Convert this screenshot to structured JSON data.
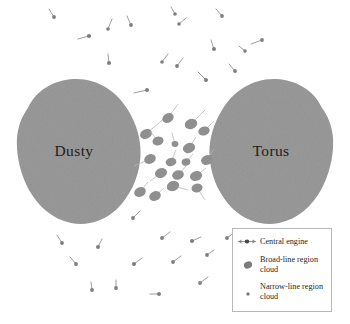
{
  "figure": {
    "type": "schematic-diagram",
    "background_color": "#ffffff"
  },
  "colors": {
    "torus_gray": "#9a9a9a",
    "cloud_gray": "#8f8f8f",
    "narrow_cloud_gray": "#7e7e7e",
    "line_gray": "#b5b5b5",
    "label_text": "#1d1d1d",
    "legend_border": "#b8b8b8",
    "legend_text": "#262626"
  },
  "torus": {
    "left_label": "Dusty",
    "right_label": "Torus"
  },
  "legend": {
    "items": [
      {
        "symbol": "central-engine-symbol",
        "label": "Central engine"
      },
      {
        "symbol": "broad-line-cloud-symbol",
        "label": "Broad-line region\ncloud"
      },
      {
        "symbol": "narrow-line-cloud-symbol",
        "label": "Narrow-line region\ncloud"
      }
    ]
  },
  "chart_data": {
    "type": "scatter",
    "title": "",
    "xlabel": "",
    "ylabel": "",
    "xlim": [
      0,
      350
    ],
    "ylim": [
      0,
      324
    ],
    "grid": false,
    "legend_position": "bottom-right",
    "annotations": [
      {
        "text": "Dusty",
        "x": 74,
        "y": 150
      },
      {
        "text": "Torus",
        "x": 268,
        "y": 150
      }
    ],
    "series": [
      {
        "name": "Dusty torus lobes",
        "type": "shape",
        "color": "#9a9a9a",
        "shapes": [
          {
            "id": "left-lobe",
            "cx": 79,
            "cy": 152,
            "rx": 64,
            "ry": 72
          },
          {
            "id": "right-lobe",
            "cx": 271,
            "cy": 152,
            "rx": 63,
            "ry": 72
          }
        ]
      },
      {
        "name": "Broad-line region cloud",
        "color": "#8f8f8f",
        "points": [
          {
            "x": 146,
            "y": 134,
            "rx": 6.2,
            "ry": 4.8,
            "rot": -25,
            "tail": [
              168,
              115
            ]
          },
          {
            "x": 168,
            "y": 118,
            "rx": 6.0,
            "ry": 4.6,
            "rot": -30,
            "tail": [
              178,
              104
            ]
          },
          {
            "x": 191,
            "y": 124,
            "rx": 6.4,
            "ry": 5.0,
            "rot": -20,
            "tail": [
              205,
              110
            ]
          },
          {
            "x": 204,
            "y": 131,
            "rx": 5.8,
            "ry": 4.4,
            "rot": -18,
            "tail": [
              214,
              121
            ]
          },
          {
            "x": 158,
            "y": 141,
            "rx": 5.6,
            "ry": 4.4,
            "rot": -15,
            "tail": [
              150,
              131
            ]
          },
          {
            "x": 175,
            "y": 144,
            "rx": 3.4,
            "ry": 3.0,
            "rot": 0,
            "tail": [
              172,
              133
            ]
          },
          {
            "x": 189,
            "y": 148,
            "rx": 6.3,
            "ry": 4.9,
            "rot": -22,
            "tail": [
              196,
              137
            ]
          },
          {
            "x": 150,
            "y": 159,
            "rx": 6.0,
            "ry": 4.7,
            "rot": -25,
            "tail": [
              134,
              166
            ]
          },
          {
            "x": 171,
            "y": 162,
            "rx": 5.4,
            "ry": 4.2,
            "rot": -12,
            "tail": [
              176,
              150
            ]
          },
          {
            "x": 207,
            "y": 160,
            "rx": 6.1,
            "ry": 4.8,
            "rot": -20,
            "tail": [
              214,
              149
            ]
          },
          {
            "x": 161,
            "y": 173,
            "rx": 6.2,
            "ry": 4.9,
            "rot": -22,
            "tail": [
              150,
              181
            ]
          },
          {
            "x": 178,
            "y": 175,
            "rx": 6.0,
            "ry": 4.7,
            "rot": -18,
            "tail": [
              187,
              165
            ]
          },
          {
            "x": 196,
            "y": 176,
            "rx": 6.2,
            "ry": 4.9,
            "rot": -20,
            "tail": [
              206,
              168
            ]
          },
          {
            "x": 173,
            "y": 186,
            "rx": 6.3,
            "ry": 5.0,
            "rot": -20,
            "tail": [
              188,
              190
            ]
          },
          {
            "x": 197,
            "y": 188,
            "rx": 5.6,
            "ry": 4.4,
            "rot": -16,
            "tail": [
              205,
              200
            ]
          },
          {
            "x": 140,
            "y": 192,
            "rx": 6.0,
            "ry": 4.7,
            "rot": -25,
            "tail": [
              148,
              182
            ]
          },
          {
            "x": 155,
            "y": 196,
            "rx": 6.0,
            "ry": 4.7,
            "rot": -22,
            "tail": [
              164,
              188
            ]
          },
          {
            "x": 186,
            "y": 162,
            "rx": 4.4,
            "ry": 3.6,
            "rot": -10,
            "tail": [
              193,
              154
            ]
          }
        ]
      },
      {
        "name": "Narrow-line region cloud",
        "color": "#7e7e7e",
        "points": [
          {
            "x": 54,
            "y": 17,
            "r": 1.9,
            "tail": [
              49,
              9
            ]
          },
          {
            "x": 89,
            "y": 36,
            "r": 2.1,
            "tail": [
              78,
              39
            ]
          },
          {
            "x": 108,
            "y": 29,
            "r": 1.8,
            "tail": [
              112,
              19
            ]
          },
          {
            "x": 131,
            "y": 25,
            "r": 1.9,
            "tail": [
              127,
              16
            ]
          },
          {
            "x": 175,
            "y": 14,
            "r": 1.8,
            "tail": [
              171,
              7
            ]
          },
          {
            "x": 222,
            "y": 16,
            "r": 1.9,
            "tail": [
              216,
              9
            ]
          },
          {
            "x": 262,
            "y": 40,
            "r": 1.9,
            "tail": [
              251,
              44
            ]
          },
          {
            "x": 214,
            "y": 49,
            "r": 2.0,
            "tail": [
              211,
              40
            ]
          },
          {
            "x": 109,
            "y": 63,
            "r": 2.0,
            "tail": [
              108,
              54
            ]
          },
          {
            "x": 162,
            "y": 62,
            "r": 1.8,
            "tail": [
              168,
              54
            ]
          },
          {
            "x": 206,
            "y": 80,
            "r": 2.0,
            "tail": [
              198,
              72
            ]
          },
          {
            "x": 235,
            "y": 71,
            "r": 1.9,
            "tail": [
              229,
              64
            ]
          },
          {
            "x": 147,
            "y": 90,
            "r": 2.0,
            "tail": [
              134,
              93
            ]
          },
          {
            "x": 177,
            "y": 66,
            "r": 1.9,
            "tail": [
              183,
              58
            ]
          },
          {
            "x": 179,
            "y": 24,
            "r": 1.8,
            "tail": [
              186,
              18
            ]
          },
          {
            "x": 245,
            "y": 51,
            "r": 1.8,
            "tail": [
              239,
              46
            ]
          },
          {
            "x": 133,
            "y": 218,
            "r": 1.9,
            "tail": [
              140,
              211
            ]
          },
          {
            "x": 62,
            "y": 243,
            "r": 1.9,
            "tail": [
              57,
              235
            ]
          },
          {
            "x": 98,
            "y": 247,
            "r": 2.0,
            "tail": [
              102,
              239
            ]
          },
          {
            "x": 162,
            "y": 238,
            "r": 1.9,
            "tail": [
              170,
              232
            ]
          },
          {
            "x": 192,
            "y": 241,
            "r": 2.0,
            "tail": [
              201,
              237
            ]
          },
          {
            "x": 227,
            "y": 238,
            "r": 1.9,
            "tail": [
              235,
              232
            ]
          },
          {
            "x": 76,
            "y": 264,
            "r": 1.9,
            "tail": [
              70,
              257
            ]
          },
          {
            "x": 134,
            "y": 264,
            "r": 2.0,
            "tail": [
              142,
              258
            ]
          },
          {
            "x": 173,
            "y": 262,
            "r": 1.9,
            "tail": [
              181,
              256
            ]
          },
          {
            "x": 207,
            "y": 255,
            "r": 1.9,
            "tail": [
              214,
              250
            ]
          },
          {
            "x": 92,
            "y": 290,
            "r": 1.9,
            "tail": [
              91,
              282
            ]
          },
          {
            "x": 116,
            "y": 288,
            "r": 1.9,
            "tail": [
              116,
              280
            ]
          },
          {
            "x": 159,
            "y": 294,
            "r": 2.0,
            "tail": [
              150,
              294
            ]
          },
          {
            "x": 200,
            "y": 283,
            "r": 1.9,
            "tail": [
              208,
              277
            ]
          },
          {
            "x": 253,
            "y": 277,
            "r": 1.8,
            "tail": [
              246,
              272
            ]
          }
        ]
      }
    ]
  }
}
